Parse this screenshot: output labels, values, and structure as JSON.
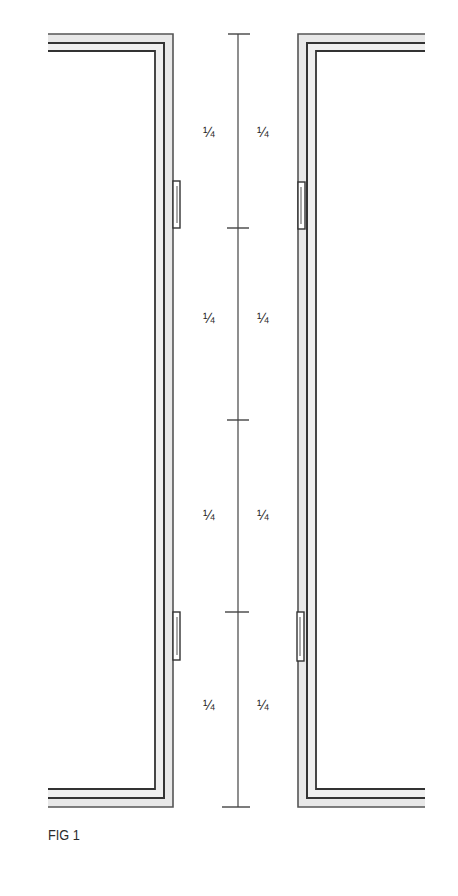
{
  "figure": {
    "caption": "FIG 1",
    "colors": {
      "line": "#3a3a3a",
      "frame_fill": "#e6e6e6",
      "background": "#ffffff"
    }
  },
  "dimension": {
    "segments": [
      {
        "left_label": "¼",
        "right_label": "¼"
      },
      {
        "left_label": "¼",
        "right_label": "¼"
      },
      {
        "left_label": "¼",
        "right_label": "¼"
      },
      {
        "left_label": "¼",
        "right_label": "¼"
      }
    ]
  },
  "hinges": {
    "left": 2,
    "right": 2
  }
}
